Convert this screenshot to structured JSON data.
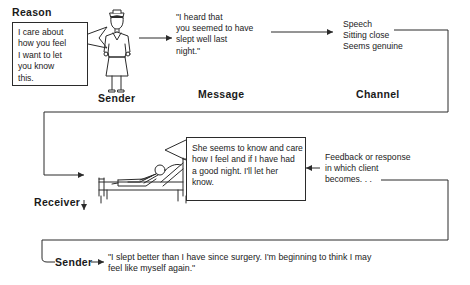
{
  "diagram": {
    "stroke_color": "#2b2b2b",
    "text_color": "#222222",
    "background": "#ffffff"
  },
  "labels": {
    "reason": "Reason",
    "sender_top": "Sender",
    "message": "Message",
    "channel": "Channel",
    "receiver": "Receiver",
    "sender_bottom": "Sender"
  },
  "boxes": {
    "reason_box": "I care about\nhow you feel\nI want to let\nyou know\nthis.",
    "receiver_box": "She seems to know and care\nhow I feel and if I have had\na good night. I'll let her\nknow."
  },
  "texts": {
    "message": "\"I heard that\nyou seemed to have\nslept well last\nnight.\"",
    "channel": "Speech\nSitting close\nSeems genuine",
    "feedback": "Feedback or response\nin which client\nbecomes. . .",
    "sender_bottom_quote": "\"I slept better than I have since surgery. I'm beginning to think I may\nfeel like myself again.\""
  },
  "figures": {
    "nurse": "nurse-standing-figure",
    "patient": "patient-in-bed-figure"
  }
}
